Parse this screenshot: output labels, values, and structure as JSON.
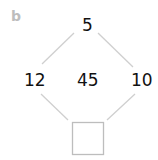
{
  "panel_label": "b",
  "diagram": {
    "top": "5",
    "left": "12",
    "right": "10",
    "center": "45",
    "bottom": "",
    "line_color": "#c8c8c8",
    "box_color": "#bdbdbd"
  }
}
